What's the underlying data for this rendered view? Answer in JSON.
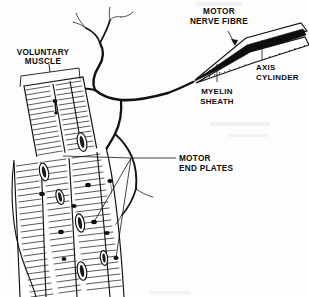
{
  "figure": {
    "background_color": "#fdfdfd",
    "ink_color": "#111111",
    "width": 309,
    "height": 297
  },
  "labels": {
    "voluntary_muscle": {
      "line1": "VOLUNTARY",
      "line2": "MUSCLE",
      "x": 43,
      "y": 58,
      "anchor": "middle",
      "leader": "bracket"
    },
    "motor_nerve_fibre": {
      "line1": "MOTOR",
      "line2": "NERVE FIBRE",
      "x": 218,
      "y": 14,
      "anchor": "middle",
      "leader": "arrow"
    },
    "axis_cylinder": {
      "line1": "AXIS",
      "line2": "CYLINDER",
      "x": 258,
      "y": 70,
      "anchor": "start",
      "leader": "vertical-line-up"
    },
    "myelin_sheath": {
      "line1": "MYELIN",
      "line2": "SHEATH",
      "x": 216,
      "y": 92,
      "anchor": "middle",
      "leader": "vertical-line-up"
    },
    "motor_end_plates": {
      "line1": "MOTOR",
      "line2": "END PLATES",
      "x": 180,
      "y": 160,
      "anchor": "start",
      "leader": "horizontal-line-left"
    }
  },
  "structures": {
    "nerve_trunk": "thick branching nerve descending from upper centre into muscle",
    "nerve_branches_top": "fine dendritic branches at top of figure",
    "muscle_band_upper": "striated voluntary muscle block, upper left, bracketed",
    "muscle_band_lower": "striated voluntary muscle fibres filling lower left",
    "myelinated_fibre": "tapered hatched nerve fibre at upper right with dark axis core",
    "end_plate_count": 8,
    "nucleus_count": 6
  }
}
